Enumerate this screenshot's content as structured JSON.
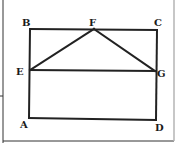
{
  "diagram": {
    "type": "geometry-figure",
    "points": [
      {
        "id": "A",
        "label": "A"
      },
      {
        "id": "B",
        "label": "B"
      },
      {
        "id": "C",
        "label": "C"
      },
      {
        "id": "D",
        "label": "D"
      },
      {
        "id": "E",
        "label": "E"
      },
      {
        "id": "F",
        "label": "F"
      },
      {
        "id": "G",
        "label": "G"
      }
    ],
    "segments": [
      [
        "A",
        "B"
      ],
      [
        "B",
        "C"
      ],
      [
        "C",
        "D"
      ],
      [
        "D",
        "A"
      ],
      [
        "E",
        "F"
      ],
      [
        "F",
        "G"
      ],
      [
        "E",
        "G"
      ]
    ],
    "colors": {
      "line": "#222222",
      "label": "#1a1a1a",
      "background": "#ffffff"
    }
  }
}
